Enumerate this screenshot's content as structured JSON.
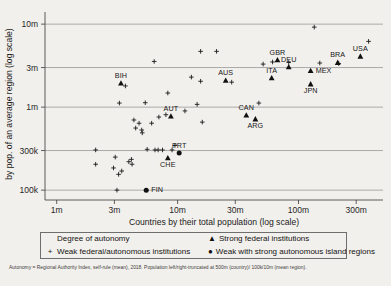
{
  "chart_data": {
    "type": "scatter",
    "title": "",
    "xlabel": "Countries by their total population (log scale)",
    "ylabel": "by pop. of an average region (log scale)",
    "xscale": "log",
    "yscale": "log",
    "xlim": [
      800000,
      500000000
    ],
    "ylim": [
      85000,
      14000000
    ],
    "grid": true,
    "grid_axis": "y",
    "xticks": [
      {
        "value": 1000000,
        "label": "1m"
      },
      {
        "value": 3000000,
        "label": "3m"
      },
      {
        "value": 10000000,
        "label": "10m"
      },
      {
        "value": 30000000,
        "label": "30m"
      },
      {
        "value": 100000000,
        "label": "100m"
      },
      {
        "value": 300000000,
        "label": "300m"
      }
    ],
    "yticks": [
      {
        "value": 100000,
        "label": "100k"
      },
      {
        "value": 300000,
        "label": "300k"
      },
      {
        "value": 1000000,
        "label": "1m"
      },
      {
        "value": 3000000,
        "label": "3m"
      },
      {
        "value": 10000000,
        "label": "10m"
      }
    ],
    "series": [
      {
        "name": "Weak federal/autonomous institutions",
        "marker": "plus",
        "points": [
          {
            "x": 2100000,
            "y": 305000
          },
          {
            "x": 2100000,
            "y": 205000
          },
          {
            "x": 2950000,
            "y": 185000
          },
          {
            "x": 3050000,
            "y": 250000
          },
          {
            "x": 3150000,
            "y": 100000
          },
          {
            "x": 3250000,
            "y": 155000
          },
          {
            "x": 3450000,
            "y": 170000
          },
          {
            "x": 3300000,
            "y": 1120000
          },
          {
            "x": 3700000,
            "y": 1800000
          },
          {
            "x": 3950000,
            "y": 220000
          },
          {
            "x": 4150000,
            "y": 235000
          },
          {
            "x": 4200000,
            "y": 205000
          },
          {
            "x": 4350000,
            "y": 700000
          },
          {
            "x": 4500000,
            "y": 560000
          },
          {
            "x": 4800000,
            "y": 640000
          },
          {
            "x": 5050000,
            "y": 530000
          },
          {
            "x": 5100000,
            "y": 490000
          },
          {
            "x": 5400000,
            "y": 1130000
          },
          {
            "x": 5600000,
            "y": 310000
          },
          {
            "x": 6100000,
            "y": 640000
          },
          {
            "x": 6400000,
            "y": 3550000
          },
          {
            "x": 6500000,
            "y": 305000
          },
          {
            "x": 6900000,
            "y": 305000
          },
          {
            "x": 7000000,
            "y": 760000
          },
          {
            "x": 7500000,
            "y": 305000
          },
          {
            "x": 8000000,
            "y": 810000
          },
          {
            "x": 8300000,
            "y": 1480000
          },
          {
            "x": 9000000,
            "y": 305000
          },
          {
            "x": 9500000,
            "y": 345000
          },
          {
            "x": 11500000,
            "y": 900000
          },
          {
            "x": 13000000,
            "y": 2300000
          },
          {
            "x": 14500000,
            "y": 1080000
          },
          {
            "x": 15500000,
            "y": 2050000
          },
          {
            "x": 15500000,
            "y": 4700000
          },
          {
            "x": 16000000,
            "y": 660000
          },
          {
            "x": 21000000,
            "y": 4700000
          },
          {
            "x": 28000000,
            "y": 2000000
          },
          {
            "x": 47000000,
            "y": 1120000
          },
          {
            "x": 51000000,
            "y": 3300000
          },
          {
            "x": 61000000,
            "y": 3500000
          },
          {
            "x": 83000000,
            "y": 3450000
          },
          {
            "x": 135000000,
            "y": 9200000
          },
          {
            "x": 150000000,
            "y": 3400000
          },
          {
            "x": 215000000,
            "y": 3350000
          },
          {
            "x": 380000000,
            "y": 6200000
          }
        ]
      },
      {
        "name": "Strong federal institutions",
        "marker": "triangle",
        "points": [
          {
            "x": 3400000,
            "y": 1950000,
            "label": "BIH",
            "label_pos": "above"
          },
          {
            "x": 8800000,
            "y": 780000,
            "label": "AUT",
            "label_pos": "above"
          },
          {
            "x": 8300000,
            "y": 245000,
            "label": "CHE",
            "label_pos": "below"
          },
          {
            "x": 25000000,
            "y": 2100000,
            "label": "AUS",
            "label_pos": "above"
          },
          {
            "x": 67000000,
            "y": 3700000,
            "label": "GBR",
            "label_pos": "above"
          },
          {
            "x": 37000000,
            "y": 800000,
            "label": "CAN",
            "label_pos": "above"
          },
          {
            "x": 44000000,
            "y": 720000,
            "label": "ARG",
            "label_pos": "below"
          },
          {
            "x": 60000000,
            "y": 2250000,
            "label": "ITA",
            "label_pos": "above"
          },
          {
            "x": 83000000,
            "y": 3050000,
            "label": "DEU",
            "label_pos": "above"
          },
          {
            "x": 126000000,
            "y": 2750000,
            "label": "MEX",
            "label_pos": "right"
          },
          {
            "x": 126000000,
            "y": 1900000,
            "label": "JPN",
            "label_pos": "below"
          },
          {
            "x": 211000000,
            "y": 3450000,
            "label": "BRA",
            "label_pos": "above"
          },
          {
            "x": 325000000,
            "y": 4100000,
            "label": "USA",
            "label_pos": "above"
          }
        ]
      },
      {
        "name": "Weak with strong autonomous island regions",
        "marker": "circle",
        "points": [
          {
            "x": 5500000,
            "y": 100000,
            "label": "FIN",
            "label_pos": "right"
          },
          {
            "x": 10300000,
            "y": 280000,
            "label": "PRT",
            "label_pos": "above"
          }
        ]
      }
    ]
  },
  "legend": {
    "title": "Degree of autonomy",
    "entries": [
      {
        "symbol": "+",
        "label": "Weak federal/autonomous institutions"
      },
      {
        "symbol": "▲",
        "label": "Strong federal institutions"
      },
      {
        "symbol": "●",
        "label": "Weak with strong autonomous island regions"
      }
    ]
  },
  "footnote": "Autonomy = Regional Authority Index, self-rule (mean), 2018. Population left/right-truncated at 500m (country)/ 100k/10m (mean region)."
}
